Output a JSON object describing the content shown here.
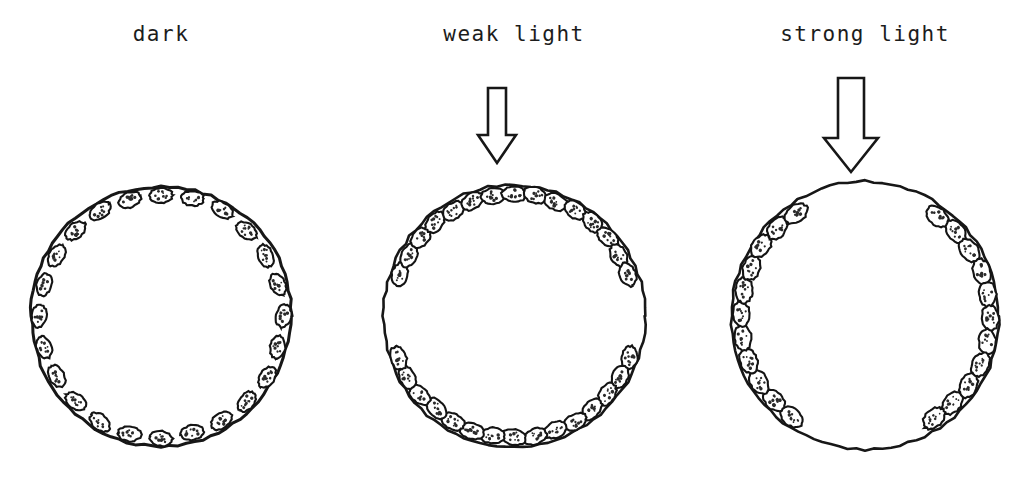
{
  "figure": {
    "width": 1028,
    "height": 485,
    "background_color": "#ffffff",
    "ink_color": "#171717",
    "chloroplast_fill": "#ffffff",
    "chloroplast_stipple_color": "#2b2b2b"
  },
  "panels": [
    {
      "id": "dark",
      "label": "dark",
      "label_x": 161,
      "has_arrow": false,
      "arrow": null,
      "cell": {
        "center_x": 161,
        "center_y": 316,
        "radius": 130,
        "stroke_width": 3.0
      },
      "chloroplast_distribution": "uniform-around-entire-cell-periphery",
      "chloroplast_count": 24,
      "chloroplast_rx": 11.5,
      "chloroplast_ry": 7.4,
      "arcs": [
        {
          "start_deg": 0,
          "end_deg": 360,
          "count": 24,
          "gap_deg": 0
        }
      ]
    },
    {
      "id": "weak-light",
      "label": "weak light",
      "label_x": 514,
      "has_arrow": true,
      "arrow": {
        "name": "downward-arrow-weak",
        "center_x": 497,
        "top_y": 88,
        "bottom_y": 163,
        "shaft_half_width": 9,
        "head_half_width": 19,
        "head_height": 28,
        "stroke_width": 2.6
      },
      "cell": {
        "center_x": 514,
        "center_y": 316,
        "radius": 131,
        "stroke_width": 2.6
      },
      "chloroplast_distribution": "accumulated-at-top-and-bottom-periclinal-walls",
      "chloroplast_count": 30,
      "chloroplast_rx": 12.0,
      "chloroplast_ry": 7.8,
      "arcs": [
        {
          "start_deg": 200,
          "end_deg": 340,
          "count": 15,
          "gap_deg": 0
        },
        {
          "start_deg": 20,
          "end_deg": 160,
          "count": 15,
          "gap_deg": 0
        }
      ]
    },
    {
      "id": "strong-light",
      "label": "strong light",
      "label_x": 865,
      "has_arrow": true,
      "arrow": {
        "name": "downward-arrow-strong",
        "center_x": 851,
        "top_y": 78,
        "bottom_y": 172,
        "shaft_half_width": 13,
        "head_half_width": 27,
        "head_height": 34,
        "stroke_width": 2.8
      },
      "cell": {
        "center_x": 865,
        "center_y": 316,
        "radius": 134,
        "stroke_width": 2.6
      },
      "chloroplast_distribution": "accumulated-at-left-and-right-anticlinal-walls",
      "chloroplast_count": 22,
      "chloroplast_rx": 12.6,
      "chloroplast_ry": 8.6,
      "arcs": [
        {
          "start_deg": 126,
          "end_deg": 236,
          "count": 11,
          "gap_deg": 0
        },
        {
          "start_deg": 306,
          "end_deg": 416,
          "count": 11,
          "gap_deg": 0
        }
      ]
    }
  ],
  "legend_note": {
    "subject": "chloroplast",
    "cell_outline": "plant cell wall",
    "arrow_meaning": "direction of incident light"
  }
}
